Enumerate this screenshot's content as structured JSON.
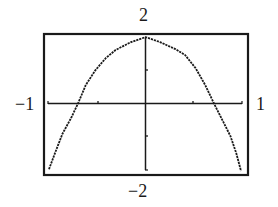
{
  "chart_data": {
    "type": "line",
    "title": "",
    "xlabel": "",
    "ylabel": "",
    "xlim": [
      -1,
      1
    ],
    "ylim": [
      -2,
      2
    ],
    "x_tick_step": 0.5,
    "y_tick_step": 1,
    "grid": false,
    "legend": null,
    "window_labels": {
      "ymax": "2",
      "ymin": "−2",
      "xmin": "−1",
      "xmax": "1"
    },
    "series": [
      {
        "name": "f(x)",
        "x": [
          -1.0,
          -0.93,
          -0.86,
          -0.77,
          -0.7,
          -0.62,
          -0.52,
          -0.41,
          -0.31,
          -0.15,
          0.0,
          0.15,
          0.31,
          0.41,
          0.52,
          0.62,
          0.71,
          0.79,
          0.88,
          0.94,
          0.99
        ],
        "y": [
          -1.98,
          -1.43,
          -0.91,
          -0.43,
          0.0,
          0.55,
          1.0,
          1.37,
          1.61,
          1.85,
          2.0,
          1.85,
          1.64,
          1.46,
          1.06,
          0.55,
          0.0,
          -0.46,
          -0.98,
          -1.49,
          -2.03
        ]
      }
    ],
    "colors": {
      "line": "#1a1a1a",
      "frame": "#1a1a1a",
      "background": "#ffffff"
    }
  }
}
